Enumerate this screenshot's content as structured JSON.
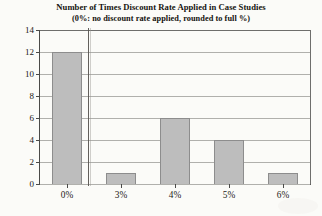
{
  "chart_data": {
    "type": "bar",
    "title": "Number of Times Discount Rate Applied in Case Studies",
    "subtitle": "(0%: no discount rate applied, rounded to full %)",
    "xlabel": "",
    "ylabel": "",
    "categories": [
      "0%",
      "3%",
      "4%",
      "5%",
      "6%"
    ],
    "values": [
      12,
      1,
      6,
      4,
      1
    ],
    "ylim": [
      0,
      14
    ],
    "ytick_labels": [
      "0",
      "2",
      "4",
      "6",
      "8",
      "10",
      "12",
      "14"
    ],
    "ytick_values": [
      0,
      2,
      4,
      6,
      8,
      10,
      12,
      14
    ],
    "grid": "horizontal",
    "legend": "none",
    "series": [
      {
        "name": "Number of Times Applied",
        "values": [
          12,
          1,
          6,
          4,
          1
        ]
      }
    ],
    "colors": {
      "bar_fill": "#bdbdbd",
      "bar_edge": "#8d8d8d",
      "axis": "#4a4a48",
      "gridline": "#b0b0ac",
      "text": "#15130f",
      "background": "#fbfbf8"
    }
  }
}
